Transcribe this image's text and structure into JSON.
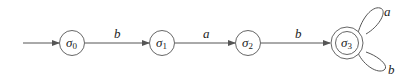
{
  "diagram": {
    "type": "finite-automaton",
    "states": [
      {
        "id": "s0",
        "symbol": "σ",
        "subscript": "0",
        "initial": true,
        "accepting": false
      },
      {
        "id": "s1",
        "symbol": "σ",
        "subscript": "1",
        "initial": false,
        "accepting": false
      },
      {
        "id": "s2",
        "symbol": "σ",
        "subscript": "2",
        "initial": false,
        "accepting": false
      },
      {
        "id": "s3",
        "symbol": "σ",
        "subscript": "3",
        "initial": false,
        "accepting": true
      }
    ],
    "transitions": [
      {
        "from": "s0",
        "to": "s1",
        "label": "b"
      },
      {
        "from": "s1",
        "to": "s2",
        "label": "a"
      },
      {
        "from": "s2",
        "to": "s3",
        "label": "b"
      },
      {
        "from": "s3",
        "to": "s3",
        "label": "a"
      },
      {
        "from": "s3",
        "to": "s3",
        "label": "b"
      }
    ],
    "colors": {
      "stroke": "#555555",
      "text": "#222222",
      "background": "#ffffff"
    }
  }
}
